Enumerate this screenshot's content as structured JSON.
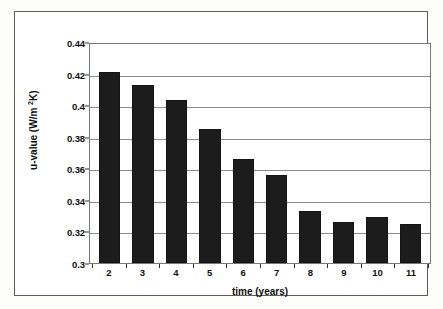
{
  "chart_data": {
    "type": "bar",
    "title": "",
    "subtitle": "",
    "xlabel": "time (years)",
    "ylabel_prefix": "u-value (W/m ",
    "ylabel_sup": "2",
    "ylabel_suffix": "K)",
    "ylabel_plain": "u-value (W/m 2K)",
    "categories": [
      "2",
      "3",
      "4",
      "5",
      "6",
      "7",
      "8",
      "9",
      "10",
      "11"
    ],
    "values": [
      0.421,
      0.413,
      0.403,
      0.385,
      0.366,
      0.356,
      0.333,
      0.326,
      0.329,
      0.325
    ],
    "ylim": [
      0.3,
      0.44
    ],
    "ytick_labels": [
      "0.44",
      "0.42",
      "0.4",
      "0.38",
      "0.36",
      "0.34",
      "0.32",
      "0.3"
    ],
    "ytick_values": [
      0.44,
      0.42,
      0.4,
      0.38,
      0.36,
      0.34,
      0.32,
      0.3
    ],
    "ytick_step": 0.02,
    "grid": true,
    "grid_axis": "y",
    "legend": false,
    "legend_position": "none",
    "series_name": "u-value",
    "bar_color": "#1c1c1c",
    "grid_color": "#8c8c8c",
    "axis_color": "#787878",
    "frame_color": "#5d5d5d",
    "background_color": "#ffffff"
  }
}
